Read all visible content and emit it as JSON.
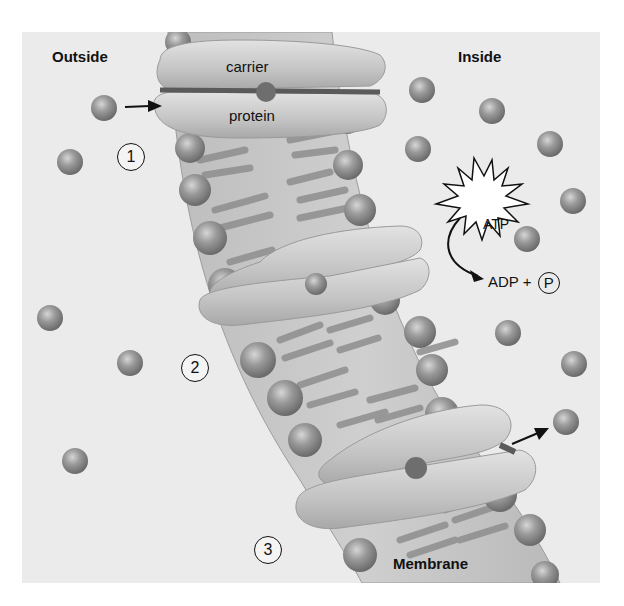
{
  "diagram": {
    "type": "active-transport-carrier-protein",
    "regions": {
      "outside": "Outside",
      "inside": "Inside",
      "membrane": "Membrane"
    },
    "carrier_label": {
      "line1": "carrier",
      "line2": "protein"
    },
    "energy": {
      "atp": "ATP",
      "adp_text": "ADP +",
      "phosphate": "P"
    },
    "steps": [
      "1",
      "2",
      "3"
    ],
    "colors": {
      "background": "#ebebeb",
      "membrane": "#c8c8c8",
      "protein": "#d2d2d2",
      "molecule": "#8c8c8c",
      "text": "#111111"
    },
    "outside_molecules": [
      {
        "x": 104,
        "y": 108
      },
      {
        "x": 70,
        "y": 162
      },
      {
        "x": 50,
        "y": 318
      },
      {
        "x": 130,
        "y": 363
      },
      {
        "x": 75,
        "y": 461
      }
    ],
    "inside_molecules": [
      {
        "x": 422,
        "y": 90
      },
      {
        "x": 492,
        "y": 111
      },
      {
        "x": 418,
        "y": 149
      },
      {
        "x": 550,
        "y": 144
      },
      {
        "x": 573,
        "y": 201
      },
      {
        "x": 527,
        "y": 239
      },
      {
        "x": 508,
        "y": 333
      },
      {
        "x": 574,
        "y": 364
      },
      {
        "x": 566,
        "y": 422
      }
    ]
  }
}
